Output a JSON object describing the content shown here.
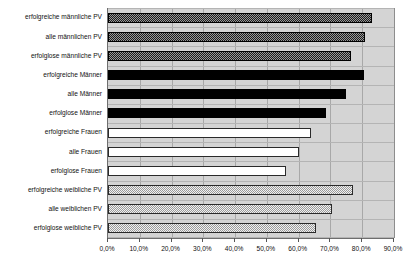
{
  "chart_data": {
    "type": "bar",
    "orientation": "horizontal",
    "title": "",
    "subtitle": "",
    "xlabel": "",
    "ylabel": "",
    "xlim": [
      0,
      90
    ],
    "xtick_labels": [
      "0,0%",
      "10,0%",
      "20,0%",
      "30,0%",
      "40,0%",
      "50,0%",
      "60,0%",
      "70,0%",
      "80,0%",
      "90,0%"
    ],
    "xtick_values": [
      0,
      10,
      20,
      30,
      40,
      50,
      60,
      70,
      80,
      90
    ],
    "xaxis_unit": "%",
    "grid": "vertical",
    "legend": "none",
    "categories": [
      "erfolgreiche männliche PV",
      "alle männlichen PV",
      "erfolglose männliche PV",
      "erfolgreiche Männer",
      "alle Männer",
      "erfolglose Männer",
      "erfolgreiche Frauen",
      "alle Frauen",
      "erfolglose Frauen",
      "erfolgreiche weibliche PV",
      "alle weiblichen PV",
      "erfolglose weibliche PV"
    ],
    "values": [
      83.0,
      80.8,
      76.5,
      80.5,
      75.0,
      68.5,
      64.0,
      60.0,
      56.0,
      77.0,
      70.5,
      65.5
    ],
    "groups": [
      {
        "name": "männliche PV",
        "style": "dark-crosshatch",
        "color": "#1b1b1b",
        "indices": [
          0,
          1,
          2
        ]
      },
      {
        "name": "Männer",
        "style": "solid-black",
        "color": "#000000",
        "indices": [
          3,
          4,
          5
        ]
      },
      {
        "name": "Frauen",
        "style": "hollow-white",
        "color": "#ffffff",
        "indices": [
          6,
          7,
          8
        ]
      },
      {
        "name": "weibliche PV",
        "style": "light-dotted",
        "color": "#f2f2f2",
        "indices": [
          9,
          10,
          11
        ]
      }
    ],
    "plot_background": "#d4d4d4",
    "gridline_color": "#a8a8a8",
    "axis_color": "#6e6e6e"
  }
}
